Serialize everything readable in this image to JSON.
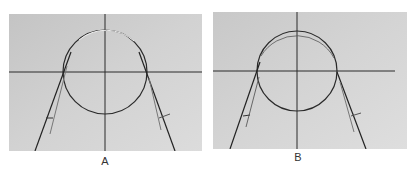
{
  "figure": {
    "panels": [
      {
        "id": "A",
        "label": "A",
        "background": "#c9c9c9",
        "circle": {
          "cx": 96,
          "cy": 58,
          "r": 42
        },
        "axes": {
          "h_y": 58,
          "v_x": 96
        }
      },
      {
        "id": "B",
        "label": "B",
        "background": "#cdcdcd",
        "circle": {
          "cx": 84,
          "cy": 59,
          "r": 40
        },
        "axes": {
          "h_y": 59,
          "v_x": 84
        }
      }
    ]
  }
}
